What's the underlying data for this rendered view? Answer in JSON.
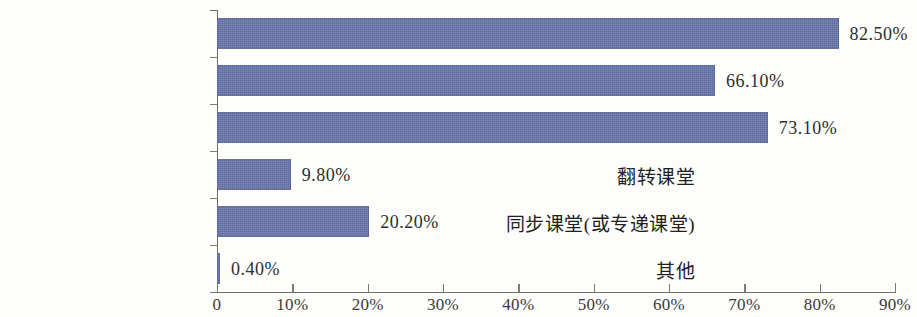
{
  "chart_data": {
    "type": "bar",
    "orientation": "horizontal",
    "title": "",
    "xlabel": "",
    "ylabel": "",
    "categories": [
      "课堂教学",
      "线上线下混合式教学",
      "线上教学",
      "翻转课堂",
      "同步课堂(或专递课堂)",
      "其他"
    ],
    "values": [
      82.5,
      66.1,
      73.1,
      9.8,
      20.2,
      0.4
    ],
    "value_labels": [
      "82.50%",
      "66.10%",
      "73.10%",
      "9.80%",
      "20.20%",
      "0.40%"
    ],
    "xlim": [
      0,
      90
    ],
    "xticks": [
      0,
      10,
      20,
      30,
      40,
      50,
      60,
      70,
      80,
      90
    ],
    "xtick_labels": [
      "0",
      "10%",
      "20%",
      "30%",
      "40%",
      "50%",
      "60%",
      "70%",
      "80%",
      "90%"
    ],
    "grid": false,
    "legend": null,
    "bar_color": "#6a77ad",
    "axis_color": "#6d6d6a",
    "background_color": "#fdfdfb",
    "text_color": "#1f1f1e"
  }
}
